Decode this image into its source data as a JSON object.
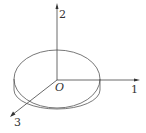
{
  "diagram": {
    "origin_label": "O",
    "axes": [
      {
        "id": "1",
        "label": "1",
        "direction": "right"
      },
      {
        "id": "2",
        "label": "2",
        "direction": "up"
      },
      {
        "id": "3",
        "label": "3",
        "direction": "down-left"
      }
    ],
    "stroke_color": "#444444",
    "background": "#ffffff"
  }
}
